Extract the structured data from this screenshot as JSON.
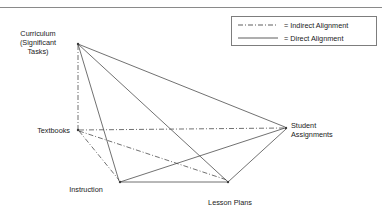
{
  "figure": {
    "type": "node-link-diagram"
  },
  "nodes": [
    {
      "id": "curriculum",
      "label": "Curriculum\n(Significant\nTasks)",
      "x": 78,
      "y": 44
    },
    {
      "id": "textbooks",
      "label": "Textbooks",
      "x": 78,
      "y": 130
    },
    {
      "id": "instruction",
      "label": "Instruction",
      "x": 120,
      "y": 182
    },
    {
      "id": "lesson_plans",
      "label": "Lesson Plans",
      "x": 228,
      "y": 182
    },
    {
      "id": "student_assignments",
      "label": "Student\nAssignments",
      "x": 286,
      "y": 128
    }
  ],
  "edges": [
    {
      "from": "curriculum",
      "to": "student_assignments",
      "kind": "direct"
    },
    {
      "from": "curriculum",
      "to": "lesson_plans",
      "kind": "direct"
    },
    {
      "from": "curriculum",
      "to": "instruction",
      "kind": "direct"
    },
    {
      "from": "curriculum",
      "to": "textbooks",
      "kind": "indirect"
    },
    {
      "from": "textbooks",
      "to": "student_assignments",
      "kind": "indirect"
    },
    {
      "from": "textbooks",
      "to": "lesson_plans",
      "kind": "indirect"
    },
    {
      "from": "textbooks",
      "to": "instruction",
      "kind": "indirect"
    },
    {
      "from": "instruction",
      "to": "lesson_plans",
      "kind": "direct"
    },
    {
      "from": "instruction",
      "to": "student_assignments",
      "kind": "direct"
    },
    {
      "from": "lesson_plans",
      "to": "student_assignments",
      "kind": "direct"
    }
  ],
  "legend": {
    "items": [
      {
        "id": "indirect",
        "style": "dash-dot",
        "text": "= Indirect Alignment"
      },
      {
        "id": "direct",
        "style": "solid",
        "text": "= Direct Alignment"
      }
    ]
  },
  "colors": {
    "line": "#4d4d4d",
    "legend_border": "#7d7d7d",
    "top_rule": "#8a8a8a",
    "text": "#1a1a1a",
    "background": "#ffffff"
  }
}
